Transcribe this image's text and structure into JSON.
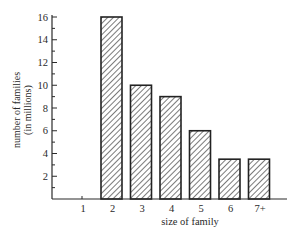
{
  "chart_data": {
    "type": "bar",
    "title": "",
    "xlabel": "size of family",
    "ylabel": "number of families (in millions)",
    "ylabel_lines": [
      "number of families",
      "(in millions)"
    ],
    "categories": [
      "1",
      "2",
      "3",
      "4",
      "5",
      "6",
      "7+"
    ],
    "values": [
      0,
      16,
      10,
      9,
      6,
      3.5,
      3.5
    ],
    "ylim": [
      0,
      16
    ],
    "yticks": [
      2,
      4,
      6,
      8,
      10,
      12,
      14,
      16
    ],
    "minor_yticks_step": 1,
    "grid": false,
    "legend": null,
    "bar_style": "diagonal hatch, black outline"
  },
  "colors": {
    "axis": "#2a2a2a",
    "bar_outline": "#222222",
    "hatch": "#333333",
    "background": "#ffffff"
  }
}
